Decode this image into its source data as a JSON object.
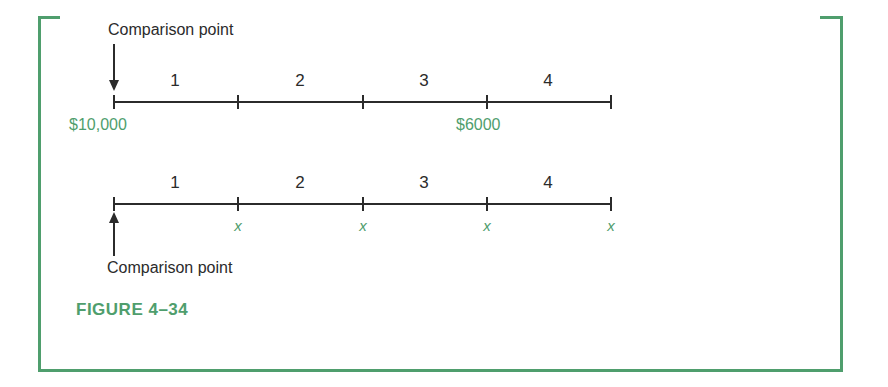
{
  "figure": {
    "caption": "FIGURE  4–34",
    "accent_color": "#4f9e6d",
    "line_color": "#2b2b2b",
    "background": "#ffffff"
  },
  "diagram": {
    "type": "timeline-comparison",
    "segment_labels": [
      "1",
      "2",
      "3",
      "4"
    ],
    "lines": [
      {
        "id": "top-line",
        "annotation": "Comparison point",
        "annotation_position": "above",
        "arrow_direction": "down",
        "arrow_target": "left-end",
        "below_labels": [
          {
            "text": "$10,000",
            "at_tick": 0
          },
          {
            "text": "$6000",
            "at_tick": 3
          }
        ]
      },
      {
        "id": "bottom-line",
        "annotation": "Comparison point",
        "annotation_position": "below",
        "arrow_direction": "up",
        "arrow_target": "left-end",
        "below_labels": [
          {
            "text": "x",
            "at_tick": 1
          },
          {
            "text": "x",
            "at_tick": 2
          },
          {
            "text": "x",
            "at_tick": 3
          },
          {
            "text": "x",
            "at_tick": 4
          }
        ]
      }
    ]
  }
}
